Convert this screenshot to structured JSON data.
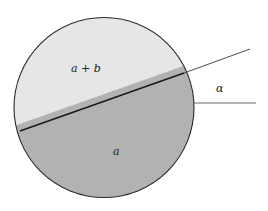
{
  "diagram": {
    "colors": {
      "background": "#ffffff",
      "upper_region": "#e6e6e6",
      "lower_region": "#b2b2b2",
      "stroke": "#2a2a2a"
    },
    "circle": {
      "cx": 104,
      "cy": 107.5,
      "r": 90
    },
    "chord": {
      "x1": 20,
      "y1": 131,
      "x2": 184,
      "y2": 73
    },
    "extension_line": {
      "x1": 184,
      "y1": 73,
      "x2": 250,
      "y2": 49
    },
    "horizontal_line": {
      "x1": 194,
      "y1": 103,
      "x2": 256,
      "y2": 103
    },
    "labels": {
      "upper": "a + b",
      "lower": "a",
      "angle": "α"
    }
  }
}
